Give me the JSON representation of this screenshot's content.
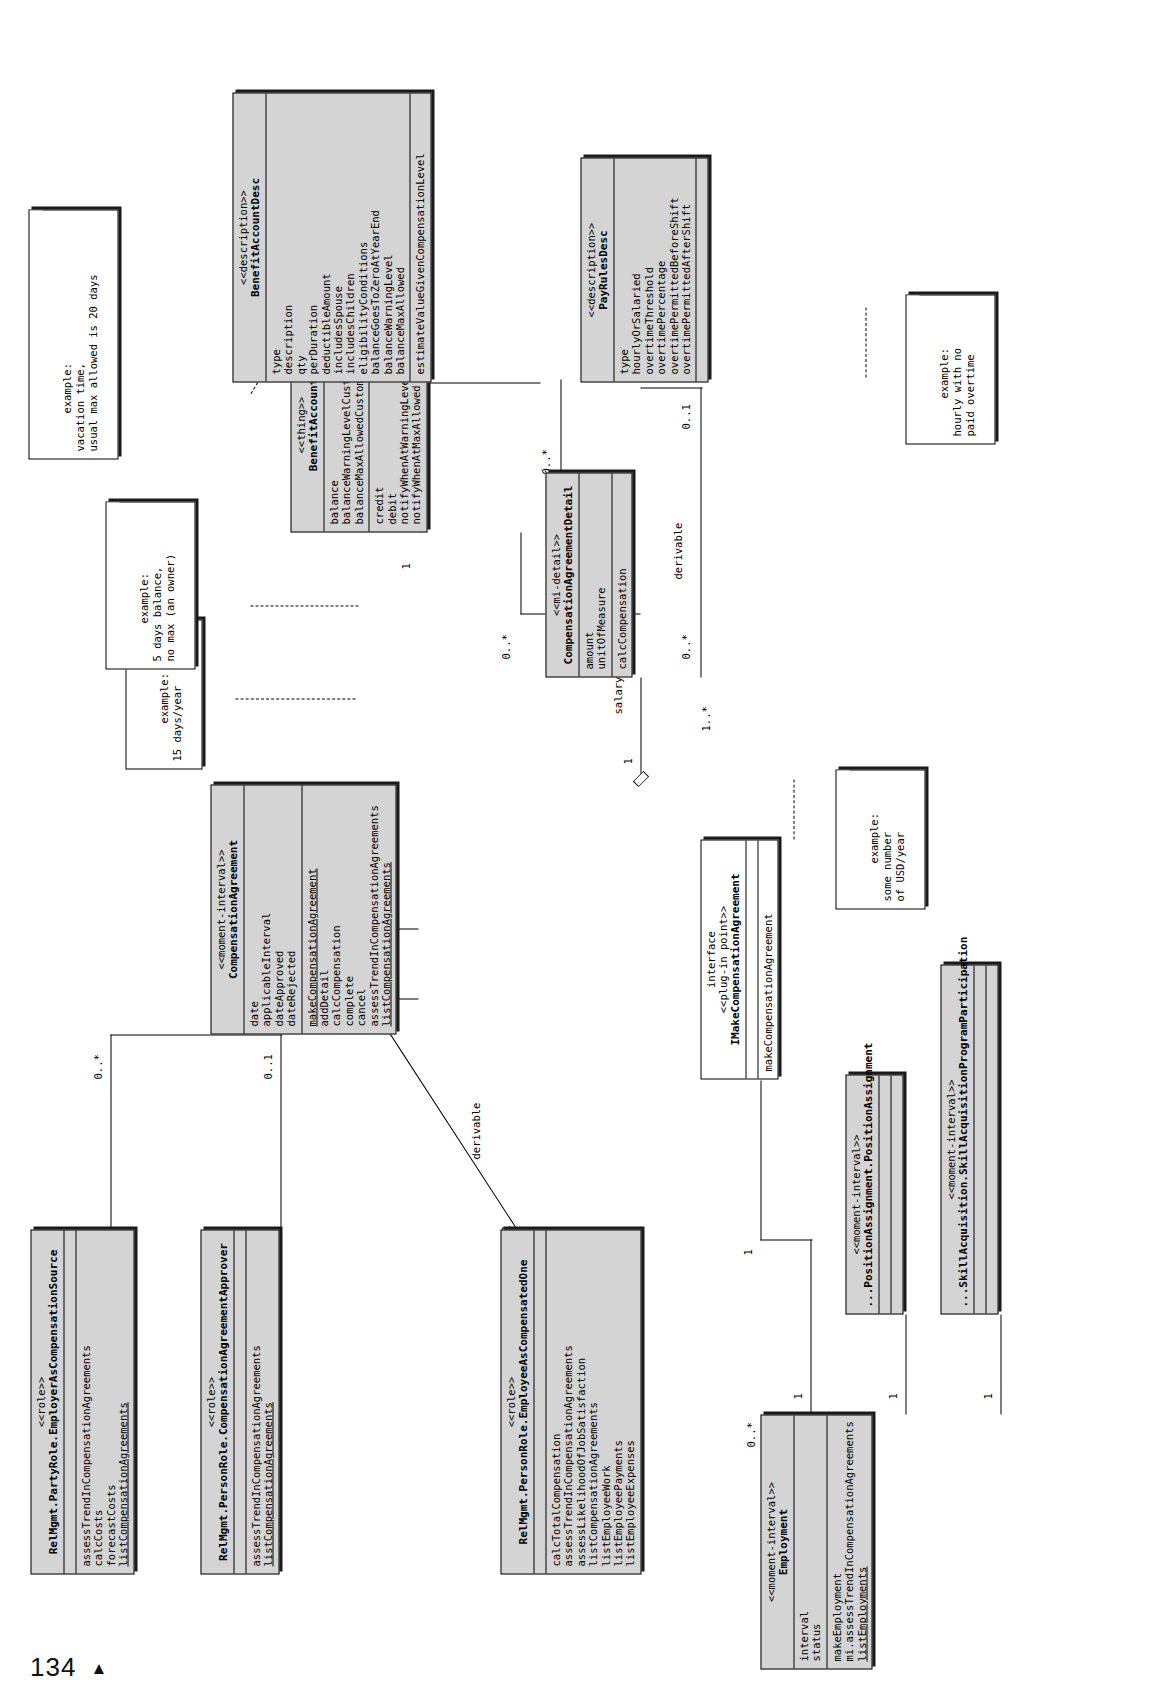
{
  "page": {
    "folio": "134",
    "marker": "▲"
  },
  "diagram": {
    "classes": [
      {
        "id": "employer-as-compensation-source",
        "stereotype": "<<role>>",
        "name": "RelMgmt.PartyRole.EmployerAsCompensationSource",
        "attributes": [],
        "operations": [
          "assessTrendInCompensationAgreements",
          "calcCosts",
          "forecastCosts",
          "listCompensationAgreements"
        ]
      },
      {
        "id": "compensation-agreement-approver",
        "stereotype": "<<role>>",
        "name": "RelMgmt.PersonRole.CompensationAgreementApprover",
        "attributes": [],
        "operations": [
          "assessTrendInCompensationAgreements",
          "listCompensationAgreements"
        ]
      },
      {
        "id": "employee-as-compensated-one",
        "stereotype": "<<role>>",
        "name": "RelMgmt.PersonRole.EmployeeAsCompensatedOne",
        "attributes": [],
        "operations": [
          "calcTotalCompensation",
          "assessTrendInCompensationAgreements",
          "assessLikelihoodOfJobSatisfaction",
          "listCompensationAgreements",
          "listEmployeeWork",
          "listEmployeePayments",
          "listEmployeeExpenses"
        ]
      },
      {
        "id": "compensation-agreement",
        "stereotype": "<<moment-interval>>",
        "name": "CompensationAgreement",
        "attributes": [
          "date",
          "applicableInterval",
          "dateApproved",
          "dateRejected"
        ],
        "operations": [
          "makeCompensationAgreement",
          "addDetail",
          "calcCompensation",
          "complete",
          "cancel",
          "assessTrendInCompensationAgreements",
          "listCompensationAgreements"
        ]
      },
      {
        "id": "employment",
        "stereotype": "<<moment-interval>>",
        "name": "Employment",
        "attributes": [
          "interval",
          "status"
        ],
        "operations": [
          "makeEmployment",
          "mi.assessTrendInCompensationAgreements",
          "listEmployments"
        ]
      },
      {
        "id": "position-assignment",
        "stereotype": "<<moment-interval>>",
        "name": "...PositionAssignment.PositionAssignment",
        "attributes": [],
        "operations": []
      },
      {
        "id": "skill-acquisition-program-participation",
        "stereotype": "<<moment-interval>>",
        "name": "...SkillAcquisition.SkillAcquisitionProgramParticipation",
        "attributes": [],
        "operations": []
      },
      {
        "id": "imake-compensation-agreement",
        "stereotype": "interface\n<<plug-in point>>",
        "stereo_line1": "interface",
        "stereo_line2": "<<plug-in point>>",
        "name": "IMakeCompensationAgreement",
        "attributes": [],
        "operations": [
          "makeCompensationAgreement"
        ]
      },
      {
        "id": "compensation-agreement-detail",
        "stereotype": "<<mi-detail>>",
        "name": "CompensationAgreementDetail",
        "attributes": [
          "amount",
          "unitOfMeasure"
        ],
        "operations": [
          "calcCompensation"
        ]
      },
      {
        "id": "benefit-account",
        "stereotype": "<<thing>>",
        "name": "BenefitAccount",
        "attributes": [
          "balance",
          "balanceWarningLevelCustom",
          "balanceMaxAllowedCustom"
        ],
        "operations": [
          "credit",
          "debit",
          "notifyWhenAtWarningLevel",
          "notifyWhenAtMaxAllowed"
        ]
      },
      {
        "id": "benefit-account-desc",
        "stereotype": "<<description>>",
        "name": "BenefitAccountDesc",
        "attributes": [
          "type",
          "description",
          "qty",
          "perDuration",
          "deductibleAmount",
          "includesSpouse",
          "includesChildren",
          "eligibilityConditions",
          "balanceGoesToZeroAtYearEnd",
          "balanceWarningLevel",
          "balanceMaxAllowed"
        ],
        "operations": [
          "estimateValueGivenCompensationLevel"
        ]
      },
      {
        "id": "pay-rules-desc",
        "stereotype": "<<description>>",
        "name": "PayRulesDesc",
        "attributes": [
          "type",
          "hourlyOrSalaried",
          "overtimeThreshold",
          "overtimePercentage",
          "overtimePermittedBeforeShift",
          "overtimePermittedAfterShift"
        ],
        "operations": []
      }
    ],
    "notes": [
      {
        "id": "note-days-per-year",
        "lines": "example:\n15 days/year"
      },
      {
        "id": "note-days-balance",
        "lines": "example:\n5 days balance,\nno max (an owner)"
      },
      {
        "id": "note-vacation-time",
        "lines": "example:\nvacation time,\nusual max allowed is 20 days"
      },
      {
        "id": "note-usd-per-year",
        "lines": "example:\nsome number\nof USD/year"
      },
      {
        "id": "note-hourly-no-overtime",
        "lines": "example:\nhourly with no\npaid overtime"
      }
    ],
    "multiplicities": [
      {
        "id": "m-employer-src",
        "value": "0..*"
      },
      {
        "id": "m-approver",
        "value": "0..1"
      },
      {
        "id": "m-ca-top",
        "value": "0..*"
      },
      {
        "id": "m-ca-left1",
        "value": "0..*"
      },
      {
        "id": "m-ca-left2",
        "value": "0..*"
      },
      {
        "id": "m-ca-detail-one",
        "value": "1"
      },
      {
        "id": "m-detail-many",
        "value": "1..*"
      },
      {
        "id": "m-ba-left",
        "value": "1"
      },
      {
        "id": "m-ba-right",
        "value": "0..*"
      },
      {
        "id": "m-ba-zero",
        "value": "0..*"
      },
      {
        "id": "m-badesc-one",
        "value": "1"
      },
      {
        "id": "m-badesc-many",
        "value": "0..*"
      },
      {
        "id": "m-detail-desc",
        "value": "0..*"
      },
      {
        "id": "m-payrules",
        "value": "0..1"
      },
      {
        "id": "m-emp-compensated",
        "value": "1"
      },
      {
        "id": "m-employment-one-a",
        "value": "1"
      },
      {
        "id": "m-employment-one-b",
        "value": "1"
      },
      {
        "id": "m-employment-one-c",
        "value": "1"
      },
      {
        "id": "m-employment-star",
        "value": "0..*"
      },
      {
        "id": "m-pos-star",
        "value": "0..*"
      },
      {
        "id": "m-skill-star",
        "value": "0..*"
      },
      {
        "id": "m-iface-one",
        "value": "1"
      },
      {
        "id": "m-emp-zero",
        "value": "0..*"
      },
      {
        "id": "m-emp-zero-2",
        "value": "0..*"
      }
    ],
    "labels": [
      {
        "id": "lbl-derivable-left",
        "value": "derivable"
      },
      {
        "id": "lbl-derivable-right",
        "value": "derivable"
      },
      {
        "id": "lbl-salary-benefits",
        "value": "salary, benefits"
      }
    ]
  }
}
